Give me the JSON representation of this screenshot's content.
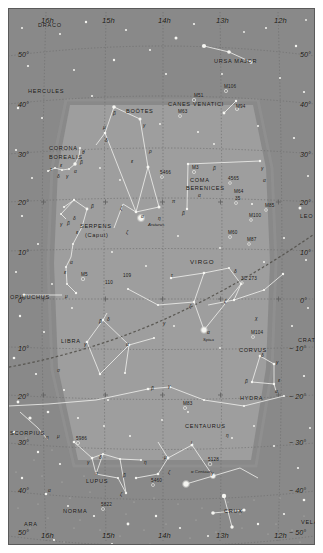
{
  "meta": {
    "type": "sky-map",
    "projection": "equatorial",
    "colors": {
      "sky_outer": "#8a8a8a",
      "sky_inner": "#9d9d9d",
      "grid": "#6e6e6e",
      "ecliptic": "#5e5b55",
      "star": "#f2f2ee",
      "constellation_line": "#e8e8e4",
      "label": "#14120f",
      "page": "#ffffff"
    },
    "ra_range": [
      "16h",
      "12h"
    ],
    "dec_range": [
      -55,
      55
    ]
  },
  "axes": {
    "ra_top": [
      "16h",
      "15h",
      "14h",
      "13h",
      "12h"
    ],
    "ra_bottom": [
      "16h",
      "15h",
      "14h",
      "13h",
      "12h"
    ],
    "dec_left": [
      "50°",
      "40°",
      "30°",
      "20°",
      "10°",
      "0°",
      "10°",
      "20°",
      "30°",
      "40°",
      "50°"
    ],
    "dec_right": [
      "50°",
      "40°",
      "30°",
      "20°",
      "10°",
      "0°",
      "− 10°",
      "− 20°",
      "− 30°",
      "− 40°",
      "− 50°"
    ]
  },
  "constellations": [
    {
      "name": "DRACO",
      "x": 30,
      "y": 14,
      "size": "n"
    },
    {
      "name": "URSA MAJOR",
      "x": 206,
      "y": 50,
      "size": "n"
    },
    {
      "name": "HERCULES",
      "x": 20,
      "y": 80,
      "size": "n"
    },
    {
      "name": "BOÖTES",
      "x": 118,
      "y": 100,
      "size": "n"
    },
    {
      "name": "CANES VENATICI",
      "x": 160,
      "y": 93,
      "size": "n"
    },
    {
      "name": "CORONA",
      "x": 41,
      "y": 137,
      "size": "n"
    },
    {
      "name": "BOREALIS",
      "x": 41,
      "y": 146,
      "size": "n"
    },
    {
      "name": "COMA",
      "x": 182,
      "y": 169,
      "size": "n"
    },
    {
      "name": "BERENICES",
      "x": 178,
      "y": 177,
      "size": "n"
    },
    {
      "name": "LEO",
      "x": 292,
      "y": 205,
      "size": "n"
    },
    {
      "name": "SERPENS",
      "x": 72,
      "y": 215,
      "size": "n"
    },
    {
      "name": "(Caput)",
      "x": 77,
      "y": 224,
      "size": "n"
    },
    {
      "name": "VIRGO",
      "x": 182,
      "y": 250,
      "size": "big"
    },
    {
      "name": "OPHIUCHUS",
      "x": 2,
      "y": 286,
      "size": "n"
    },
    {
      "name": "LIBRA",
      "x": 53,
      "y": 330,
      "size": "n"
    },
    {
      "name": "CORVUS",
      "x": 231,
      "y": 339,
      "size": "n"
    },
    {
      "name": "CRATER",
      "x": 290,
      "y": 329,
      "size": "n"
    },
    {
      "name": "HYDRA",
      "x": 232,
      "y": 387,
      "size": "n"
    },
    {
      "name": "SCORPIUS",
      "x": 2,
      "y": 422,
      "size": "n"
    },
    {
      "name": "CENTAURUS",
      "x": 177,
      "y": 415,
      "size": "n"
    },
    {
      "name": "LUPUS",
      "x": 78,
      "y": 470,
      "size": "n"
    },
    {
      "name": "NORMA",
      "x": 55,
      "y": 500,
      "size": "n"
    },
    {
      "name": "ARA",
      "x": 16,
      "y": 513,
      "size": "n"
    },
    {
      "name": "CRUX",
      "x": 216,
      "y": 500,
      "size": "n"
    },
    {
      "name": "VELA",
      "x": 293,
      "y": 511,
      "size": "n"
    }
  ],
  "deep_sky_objects": [
    {
      "label": "M51",
      "x": 186,
      "y": 85
    },
    {
      "label": "M106",
      "x": 216,
      "y": 76
    },
    {
      "label": "M94",
      "x": 228,
      "y": 96
    },
    {
      "label": "M63",
      "x": 170,
      "y": 101
    },
    {
      "label": "5466",
      "x": 152,
      "y": 162
    },
    {
      "label": "M3",
      "x": 184,
      "y": 157
    },
    {
      "label": "4565",
      "x": 220,
      "y": 168
    },
    {
      "label": "M64",
      "x": 226,
      "y": 181
    },
    {
      "label": "35",
      "x": 227,
      "y": 188
    },
    {
      "label": "M85",
      "x": 257,
      "y": 195
    },
    {
      "label": "M100",
      "x": 241,
      "y": 205
    },
    {
      "label": "M60",
      "x": 220,
      "y": 222
    },
    {
      "label": "M87",
      "x": 239,
      "y": 229
    },
    {
      "label": "M5",
      "x": 73,
      "y": 264
    },
    {
      "label": "109",
      "x": 115,
      "y": 265
    },
    {
      "label": "110",
      "x": 97,
      "y": 272
    },
    {
      "label": "3C 273",
      "x": 233,
      "y": 268
    },
    {
      "label": "M104",
      "x": 243,
      "y": 322
    },
    {
      "label": "M83",
      "x": 175,
      "y": 393
    },
    {
      "label": "5986",
      "x": 68,
      "y": 428
    },
    {
      "label": "5128",
      "x": 200,
      "y": 449
    },
    {
      "label": "5460",
      "x": 143,
      "y": 470
    },
    {
      "label": "5822",
      "x": 93,
      "y": 494
    }
  ],
  "named_stars": [
    {
      "label": "Arcturus",
      "x": 140,
      "y": 214
    },
    {
      "label": "Spica",
      "x": 195,
      "y": 329
    },
    {
      "label": "α Centauri",
      "x": 183,
      "y": 461
    }
  ],
  "greek_labels": [
    {
      "g": "τ",
      "x": 42,
      "y": 159
    },
    {
      "g": "ε",
      "x": 52,
      "y": 155
    },
    {
      "g": "δ",
      "x": 49,
      "y": 166
    },
    {
      "g": "γ",
      "x": 58,
      "y": 166
    },
    {
      "g": "α",
      "x": 66,
      "y": 161
    },
    {
      "g": "β",
      "x": 72,
      "y": 152
    },
    {
      "g": "θ",
      "x": 74,
      "y": 142
    },
    {
      "g": "β",
      "x": 105,
      "y": 103
    },
    {
      "g": "μ",
      "x": 95,
      "y": 117
    },
    {
      "g": "δ",
      "x": 97,
      "y": 130
    },
    {
      "g": "γ",
      "x": 135,
      "y": 115
    },
    {
      "g": "ρ",
      "x": 141,
      "y": 141
    },
    {
      "g": "ε",
      "x": 123,
      "y": 151
    },
    {
      "g": "η",
      "x": 150,
      "y": 208
    },
    {
      "g": "α",
      "x": 133,
      "y": 206
    },
    {
      "g": "ζ",
      "x": 112,
      "y": 198
    },
    {
      "g": "ζ",
      "x": 118,
      "y": 222
    },
    {
      "g": "β",
      "x": 83,
      "y": 196
    },
    {
      "g": "γ",
      "x": 52,
      "y": 214
    },
    {
      "g": "β",
      "x": 59,
      "y": 213
    },
    {
      "g": "δ",
      "x": 65,
      "y": 208
    },
    {
      "g": "ε",
      "x": 68,
      "y": 222
    },
    {
      "g": "α",
      "x": 62,
      "y": 252
    },
    {
      "g": "ε",
      "x": 56,
      "y": 262
    },
    {
      "g": "μ",
      "x": 57,
      "y": 286
    },
    {
      "g": "β",
      "x": 174,
      "y": 203
    },
    {
      "g": "α",
      "x": 255,
      "y": 170
    },
    {
      "g": "γ",
      "x": 253,
      "y": 158
    },
    {
      "g": "β",
      "x": 205,
      "y": 158
    },
    {
      "g": "α",
      "x": 190,
      "y": 185
    },
    {
      "g": "π",
      "x": 164,
      "y": 191
    },
    {
      "g": "τ",
      "x": 163,
      "y": 265
    },
    {
      "g": "δ",
      "x": 226,
      "y": 261
    },
    {
      "g": "ζ",
      "x": 181,
      "y": 296
    },
    {
      "g": "ζ",
      "x": 216,
      "y": 291
    },
    {
      "g": "α",
      "x": 199,
      "y": 322
    },
    {
      "g": "γ",
      "x": 155,
      "y": 313
    },
    {
      "g": "β",
      "x": 91,
      "y": 311
    },
    {
      "g": "δ",
      "x": 99,
      "y": 309
    },
    {
      "g": "γ",
      "x": 76,
      "y": 334
    },
    {
      "g": "α",
      "x": 118,
      "y": 334
    },
    {
      "g": "σ",
      "x": 49,
      "y": 360
    },
    {
      "g": "χ",
      "x": 247,
      "y": 308
    },
    {
      "g": "δ",
      "x": 253,
      "y": 345
    },
    {
      "g": "γ",
      "x": 268,
      "y": 352
    },
    {
      "g": "ε",
      "x": 270,
      "y": 370
    },
    {
      "g": "β",
      "x": 237,
      "y": 371
    },
    {
      "g": "α",
      "x": 267,
      "y": 381
    },
    {
      "g": "β",
      "x": 143,
      "y": 378
    },
    {
      "g": "γ",
      "x": 160,
      "y": 376
    },
    {
      "g": "μ",
      "x": 49,
      "y": 426
    },
    {
      "g": "η",
      "x": 38,
      "y": 427
    },
    {
      "g": "η",
      "x": 218,
      "y": 425
    },
    {
      "g": "ι",
      "x": 183,
      "y": 432
    },
    {
      "g": "μ",
      "x": 156,
      "y": 447
    },
    {
      "g": "ζ",
      "x": 160,
      "y": 462
    },
    {
      "g": "γ",
      "x": 79,
      "y": 452
    },
    {
      "g": "δ",
      "x": 91,
      "y": 447
    },
    {
      "g": "α",
      "x": 87,
      "y": 463
    },
    {
      "g": "β",
      "x": 115,
      "y": 465
    },
    {
      "g": "η",
      "x": 136,
      "y": 452
    },
    {
      "g": "ζ",
      "x": 112,
      "y": 484
    },
    {
      "g": "γ",
      "x": 203,
      "y": 463
    },
    {
      "g": "α",
      "x": 40,
      "y": 480
    }
  ]
}
